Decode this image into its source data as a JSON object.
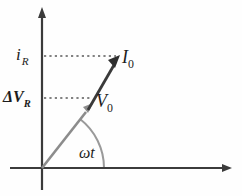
{
  "figure": {
    "type": "phasor-diagram",
    "background_color": "#fefefe",
    "axes": {
      "axis_color": "#3b3b3b",
      "vertical": {
        "x": 42,
        "top_y": 8,
        "bottom_y": 190
      },
      "horizontal": {
        "y": 168,
        "left_x": 10,
        "right_x": 232
      },
      "origin": {
        "x": 42,
        "y": 168
      }
    },
    "labels": {
      "current_amplitude": {
        "base": "i",
        "sub": "R"
      },
      "voltage_amplitude": {
        "base": "ΔV",
        "sub": "R"
      },
      "current_phasor": {
        "base": "I",
        "sub": "0"
      },
      "voltage_phasor": {
        "base": "V",
        "sub": "0"
      },
      "angle": "ωt"
    },
    "phasors": [
      {
        "name": "voltage-phasor",
        "label": "V0",
        "color": "#8c8c8c",
        "from": {
          "x": 42,
          "y": 168
        },
        "to": {
          "x": 93,
          "y": 103
        }
      },
      {
        "name": "current-phasor",
        "label": "I0",
        "color": "#2e2e2e",
        "from": {
          "x": 93,
          "y": 103
        },
        "to": {
          "x": 120,
          "y": 56
        }
      }
    ],
    "projection_lines": [
      {
        "name": "current-projection",
        "y": 56,
        "from_x": 44,
        "to_x": 118,
        "color": "#5a5a5a",
        "style": "dotted"
      },
      {
        "name": "voltage-projection",
        "y": 98,
        "from_x": 44,
        "to_x": 92,
        "color": "#5a5a5a",
        "style": "dotted"
      }
    ],
    "angle_arc": {
      "name": "omega-t-arc",
      "color": "#9a9a9a",
      "center": {
        "x": 42,
        "y": 168
      },
      "radius": 62,
      "start_deg": 0,
      "end_deg": 52
    }
  }
}
